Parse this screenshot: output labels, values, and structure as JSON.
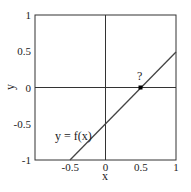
{
  "chart_data": {
    "type": "line",
    "title": "",
    "xlabel": "x",
    "ylabel": "y",
    "xlim": [
      -1,
      1
    ],
    "ylim": [
      -1,
      1
    ],
    "xticks": [
      "-0.5",
      "0",
      "0.5",
      "1"
    ],
    "yticks": [
      "-1",
      "-0.5",
      "0",
      "0.5",
      "1"
    ],
    "grid": false,
    "axes_lines": [
      "x=0",
      "y=0"
    ],
    "series": [
      {
        "name": "y = f(x)",
        "x": [
          -0.5,
          1
        ],
        "y": [
          -1,
          0.5
        ]
      }
    ],
    "annotations": [
      {
        "text": "y = f(x)",
        "x": -0.62,
        "y": -0.72
      },
      {
        "text": "?",
        "x": 0.5,
        "y": 0.1
      },
      {
        "marker": "square",
        "x": 0.5,
        "y": 0
      }
    ]
  }
}
